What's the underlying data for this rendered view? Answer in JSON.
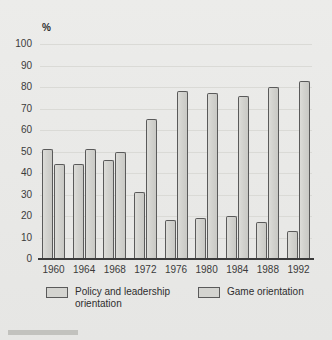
{
  "chart_data": {
    "type": "bar",
    "title": "",
    "xlabel": "",
    "ylabel": "%",
    "ylim": [
      0,
      100
    ],
    "y_ticks": [
      100,
      90,
      80,
      70,
      60,
      50,
      40,
      30,
      20,
      10,
      0
    ],
    "grid": true,
    "legend_position": "bottom",
    "categories": [
      "1960",
      "1964",
      "1968",
      "1972",
      "1976",
      "1980",
      "1984",
      "1988",
      "1992"
    ],
    "series": [
      {
        "name": "Policy and leadership orientation",
        "values": [
          51,
          44,
          46,
          31,
          18,
          19,
          20,
          17,
          13
        ]
      },
      {
        "name": "Game orientation",
        "values": [
          44,
          51,
          50,
          65,
          78,
          77,
          76,
          80,
          83
        ]
      }
    ]
  },
  "legend": {
    "entries": [
      {
        "label_line1": "Policy and leadership",
        "label_line2": "orientation"
      },
      {
        "label_line1": "Game orientation",
        "label_line2": ""
      }
    ]
  },
  "colors": {
    "background": "#ebebe9",
    "bar_fill": "#d4d4d0",
    "bar_outline": "#5a5a5a",
    "axis": "#3a3a3a",
    "gridline": "#dadad6",
    "text": "#2e2e2e"
  }
}
